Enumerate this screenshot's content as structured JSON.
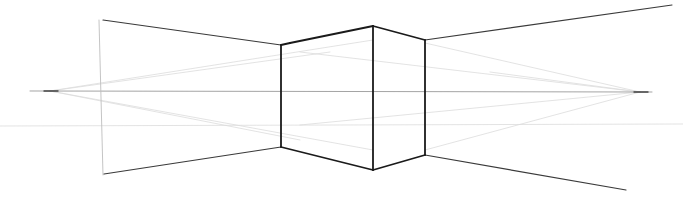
{
  "drawing": {
    "width": 683,
    "height": 198,
    "background": "#ffffff",
    "vanishing_points": {
      "left": [
        50,
        91
      ],
      "right": [
        640,
        92
      ]
    },
    "colors": {
      "ink": "#1a1a1a",
      "ray": "#3a3a3a",
      "guide": "#bdbdbd",
      "faint": "#dcdcdc"
    },
    "horizon_line": {
      "x1": 30,
      "y1": 91,
      "x2": 652,
      "y2": 92
    },
    "lower_guide_line": {
      "x1": 0,
      "y1": 126,
      "x2": 683,
      "y2": 124
    },
    "frame_line_left": {
      "x1": 99,
      "y1": 20,
      "x2": 103,
      "y2": 175
    },
    "box": {
      "left_top": [
        281,
        45
      ],
      "left_bottom": [
        281,
        147
      ],
      "front_top": [
        373,
        26
      ],
      "front_bottom": [
        373,
        170
      ],
      "right_top": [
        425,
        40
      ],
      "right_bottom": [
        425,
        155
      ],
      "left_top_notch": [
        290,
        43
      ]
    },
    "dark_rays": [
      {
        "name": "upper-left-ray",
        "x1": 103,
        "y1": 20,
        "x2": 281,
        "y2": 45
      },
      {
        "name": "lower-left-ray",
        "x1": 104,
        "y1": 174,
        "x2": 281,
        "y2": 147
      },
      {
        "name": "upper-right-ray",
        "x1": 425,
        "y1": 40,
        "x2": 672,
        "y2": 5
      },
      {
        "name": "lower-right-ray",
        "x1": 425,
        "y1": 155,
        "x2": 626,
        "y2": 190
      }
    ],
    "guide_rays": [
      {
        "x1": 50,
        "y1": 91,
        "x2": 373,
        "y2": 40
      },
      {
        "x1": 50,
        "y1": 91,
        "x2": 330,
        "y2": 52
      },
      {
        "x1": 50,
        "y1": 91,
        "x2": 373,
        "y2": 150
      },
      {
        "x1": 50,
        "y1": 91,
        "x2": 300,
        "y2": 140
      },
      {
        "x1": 640,
        "y1": 92,
        "x2": 425,
        "y2": 43
      },
      {
        "x1": 640,
        "y1": 92,
        "x2": 490,
        "y2": 72
      },
      {
        "x1": 640,
        "y1": 92,
        "x2": 425,
        "y2": 150
      },
      {
        "x1": 640,
        "y1": 92,
        "x2": 300,
        "y2": 52
      },
      {
        "x1": 640,
        "y1": 92,
        "x2": 300,
        "y2": 125
      }
    ]
  }
}
